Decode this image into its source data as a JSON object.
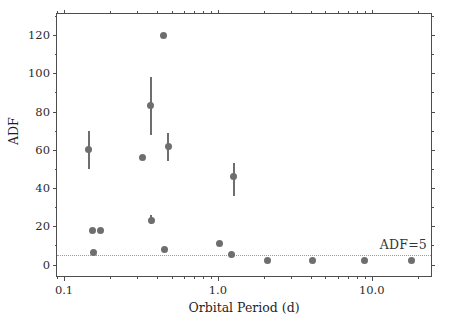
{
  "chart_data": {
    "type": "scatter",
    "title": "",
    "xlabel": "Orbital Period (d)",
    "ylabel": "ADF",
    "xscale": "log",
    "yscale": "linear",
    "xlim": [
      0.09,
      25.0
    ],
    "ylim": [
      -7,
      131
    ],
    "xticks": [
      0.1,
      1.0,
      10.0
    ],
    "xtick_labels": [
      "0.1",
      "1.0",
      "10.0"
    ],
    "yticks": [
      0,
      20,
      40,
      60,
      80,
      100,
      120
    ],
    "ytick_labels": [
      "0",
      "20",
      "40",
      "60",
      "80",
      "100",
      "120"
    ],
    "grid": false,
    "legend": null,
    "marker_color": "#6e6e6e",
    "threshold": {
      "value": 5,
      "label": "ADF=5",
      "style": "dotted",
      "color": "#9b9b9b"
    },
    "points": [
      {
        "x": 0.145,
        "y": 60,
        "yerr_low": 50,
        "yerr_high": 70
      },
      {
        "x": 0.155,
        "y": 6.5,
        "yerr_low": 6.5,
        "yerr_high": 6.5
      },
      {
        "x": 0.153,
        "y": 18,
        "yerr_low": 18,
        "yerr_high": 18
      },
      {
        "x": 0.172,
        "y": 18,
        "yerr_low": 18,
        "yerr_high": 18
      },
      {
        "x": 0.322,
        "y": 56,
        "yerr_low": 56,
        "yerr_high": 56
      },
      {
        "x": 0.367,
        "y": 83,
        "yerr_low": 68,
        "yerr_high": 98
      },
      {
        "x": 0.368,
        "y": 23,
        "yerr_low": 21,
        "yerr_high": 26
      },
      {
        "x": 0.44,
        "y": 120,
        "yerr_low": 120,
        "yerr_high": 120
      },
      {
        "x": 0.448,
        "y": 8,
        "yerr_low": 8,
        "yerr_high": 8
      },
      {
        "x": 0.475,
        "y": 62,
        "yerr_low": 54,
        "yerr_high": 69
      },
      {
        "x": 1.03,
        "y": 11,
        "yerr_low": 11,
        "yerr_high": 11
      },
      {
        "x": 1.22,
        "y": 5.5,
        "yerr_low": 5.5,
        "yerr_high": 5.5
      },
      {
        "x": 1.27,
        "y": 46,
        "yerr_low": 36,
        "yerr_high": 53
      },
      {
        "x": 2.1,
        "y": 2,
        "yerr_low": 2,
        "yerr_high": 2
      },
      {
        "x": 4.1,
        "y": 2,
        "yerr_low": 2,
        "yerr_high": 2
      },
      {
        "x": 9.0,
        "y": 2,
        "yerr_low": 2,
        "yerr_high": 2
      },
      {
        "x": 18.0,
        "y": 2,
        "yerr_low": 2,
        "yerr_high": 2
      }
    ]
  }
}
